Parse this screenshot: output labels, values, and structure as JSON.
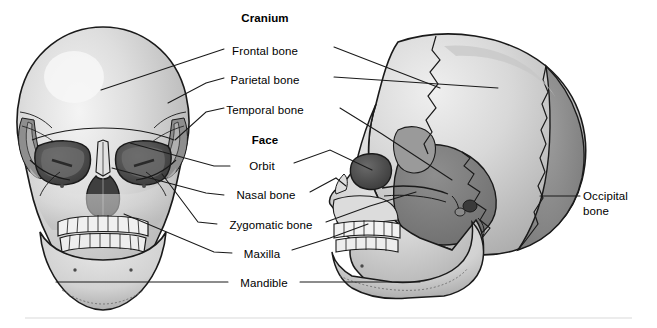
{
  "figure": {
    "title_headings": [
      {
        "id": "cranium",
        "text": "Cranium",
        "x": 265,
        "y": 12,
        "bold": true
      },
      {
        "id": "face",
        "text": "Face",
        "x": 265,
        "y": 134,
        "bold": true
      }
    ],
    "labels": [
      {
        "id": "frontal-bone",
        "text": "Frontal bone",
        "x": 265,
        "y": 45
      },
      {
        "id": "parietal-bone",
        "text": "Parietal bone",
        "x": 265,
        "y": 74
      },
      {
        "id": "temporal-bone",
        "text": "Temporal bone",
        "x": 265,
        "y": 104
      },
      {
        "id": "orbit",
        "text": "Orbit",
        "x": 265,
        "y": 162
      },
      {
        "id": "nasal-bone",
        "text": "Nasal bone",
        "x": 265,
        "y": 191
      },
      {
        "id": "zygomatic-bone",
        "text": "Zygomatic bone",
        "x": 265,
        "y": 221
      },
      {
        "id": "maxilla",
        "text": "Maxilla",
        "x": 265,
        "y": 250
      },
      {
        "id": "mandible",
        "text": "Mandible",
        "x": 265,
        "y": 279
      },
      {
        "id": "occipital-bone",
        "text": "Occipital bone",
        "x": 607,
        "y": 194
      }
    ],
    "views": [
      {
        "id": "anterior-skull",
        "name": "anterior view of skull"
      },
      {
        "id": "lateral-skull",
        "name": "lateral view of skull"
      }
    ],
    "colors": {
      "background": "#ffffff",
      "bone_light": "#d9d9d9",
      "bone_highlight": "#f2f2f2",
      "bone_mid": "#bdbdbd",
      "bone_shadow": "#9a9a9a",
      "bone_dark": "#808080",
      "cavity_dark": "#4a4a4a",
      "outline": "#1a1a1a",
      "leader_line": "#1a1a1a",
      "footer_rule": "#e2e2e2",
      "text": "#000000"
    },
    "footer_rule": {
      "y": 318
    }
  }
}
